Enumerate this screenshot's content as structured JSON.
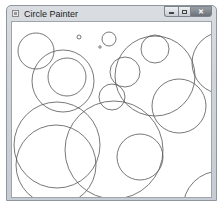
{
  "window": {
    "title": "Circle Painter",
    "controls": {
      "minimize": "minimize",
      "maximize": "maximize",
      "close_glyph": "✕"
    }
  },
  "canvas": {
    "offset": {
      "x": 11,
      "y": 21
    },
    "stroke_color": "#555555",
    "circles": [
      {
        "cx": 35,
        "cy": 50,
        "r": 18
      },
      {
        "cx": 66,
        "cy": 76,
        "r": 19
      },
      {
        "cx": 62,
        "cy": 80,
        "r": 31
      },
      {
        "cx": 78,
        "cy": 36,
        "r": 2
      },
      {
        "cx": 99,
        "cy": 46,
        "r": 1.2
      },
      {
        "cx": 108,
        "cy": 38,
        "r": 7
      },
      {
        "cx": 154,
        "cy": 75,
        "r": 40
      },
      {
        "cx": 154,
        "cy": 48,
        "r": 14
      },
      {
        "cx": 124,
        "cy": 71,
        "r": 15
      },
      {
        "cx": 111,
        "cy": 96,
        "r": 13
      },
      {
        "cx": 178,
        "cy": 105,
        "r": 27
      },
      {
        "cx": 222,
        "cy": 62,
        "r": 31
      },
      {
        "cx": 56,
        "cy": 144,
        "r": 43
      },
      {
        "cx": 55,
        "cy": 164,
        "r": 40
      },
      {
        "cx": 113,
        "cy": 149,
        "r": 49
      },
      {
        "cx": 139,
        "cy": 156,
        "r": 23
      },
      {
        "cx": 219,
        "cy": 207,
        "r": 37
      }
    ]
  }
}
